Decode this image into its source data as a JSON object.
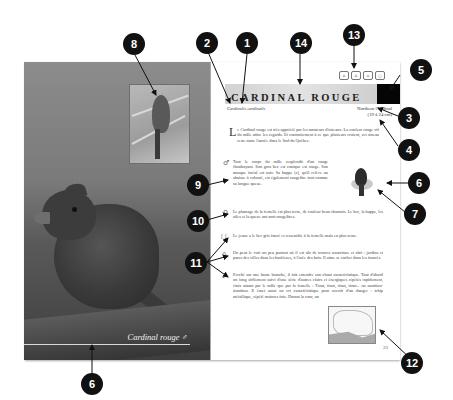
{
  "spread": {
    "photo_caption": "Cardinal rouge ♂",
    "title": "CARDINAL ROUGE",
    "scientific_name": "Cardinalis cardinalis",
    "english_name": "Northern Cardinal",
    "size": "(19 à 24 cm)",
    "header_icons": [
      {
        "name": "feeder-icon",
        "glyph": "⌂"
      },
      {
        "name": "birdhouse-icon",
        "glyph": "⌂"
      },
      {
        "name": "nest-icon",
        "glyph": "∪"
      },
      {
        "name": "egg-icon",
        "glyph": "○"
      }
    ],
    "intro_dropcap": "L",
    "intro": "e Cardinal rouge est très apprécié par les amateurs d'oiseaux. La couleur rouge vif du mâle attire les regards. Et contrairement à ce que plusieurs croient, cet oiseau reste toute l'année dans le Sud du Québec.",
    "male_symbol": "♂",
    "male_text": "Tout le corps du mâle resplendit d'un rouge flamboyant. Son gros bec est conique est rouge. Son masque facial est noir. Sa huppe (c), qu'il relève ou abaisse à volonté, est également rougeâtre tout comme sa longue queue.",
    "female_symbol": "♀",
    "female_text": "Le plumage de la femelle est plus terne, de couleur beun chamois. Le bec, la huppe, les ailes et la queue ont sont rougeâtres.",
    "juvenile_icon": "[ ]",
    "juvenile_text": "Le jeune a le bec gris foncé et ressemble à la femelle mais en plus terne.",
    "habitat_icon": "⌂",
    "habitat_text": "On peut le voir un peu partout où il est sûr de trouver nourriture et abri : jardins et parcs des villes dans les banlieues, à l'orée des bois. Il aime se cacher dans les fourrés.",
    "song_icon": "♪",
    "song_text": "Perché sur une haute branche, il fait entendre son chant caractéristique. Tout d'abord un long sifflement suivi d'une série d'autres clairs et énergiques répétés rapidement, émis autant par le mâle que par la femelle : Tiout, tiout, tiout, tiout... ou ouattiou-tiouttiou. Il émet aussi un cri caractéristique pour avertir d'un danger : tchip métallique, répété maintes fois. Durant la cour, on",
    "page_number": "23"
  },
  "callouts": [
    "1",
    "2",
    "3",
    "4",
    "5",
    "6",
    "7",
    "8",
    "9",
    "10",
    "11",
    "12",
    "13",
    "14",
    "6"
  ]
}
